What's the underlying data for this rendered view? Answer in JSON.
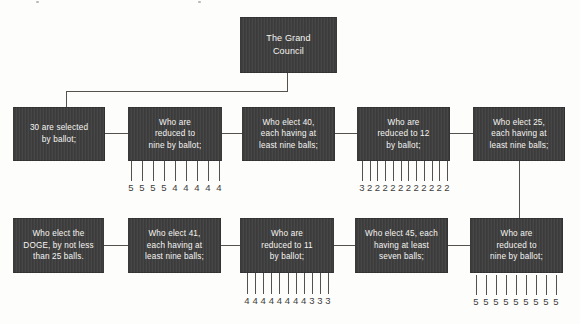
{
  "diagram": {
    "council": {
      "label": "The Grand\nCouncil"
    },
    "row1": [
      {
        "id": "node-30-selected",
        "label": "30 are selected\nby ballot;"
      },
      {
        "id": "node-reduced-to-nine-1",
        "label": "Who are\nreduced to\nnine by ballot;"
      },
      {
        "id": "node-elect-40",
        "label": "Who elect 40,\neach having at\nleast nine balls;"
      },
      {
        "id": "node-reduced-to-12",
        "label": "Who are\nreduced to 12\nby ballot;"
      },
      {
        "id": "node-elect-25",
        "label": "Who elect 25,\neach having at\nleast nine balls;"
      }
    ],
    "row2": [
      {
        "id": "node-elect-doge",
        "label": "Who elect the\nDOGE, by not less\nthan 25 balls."
      },
      {
        "id": "node-elect-41",
        "label": "Who elect 41,\neach having at\nleast nine balls;"
      },
      {
        "id": "node-reduced-to-11",
        "label": "Who are\nreduced to 11\nby ballot;"
      },
      {
        "id": "node-elect-45",
        "label": "Who elect 45, each\nhaving at least\nseven balls;"
      },
      {
        "id": "node-reduced-to-nine-2",
        "label": "Who are\nreduced to\nnine by ballot;"
      }
    ],
    "tick_groups": [
      {
        "under": "node-reduced-to-nine-1",
        "values": [
          5,
          5,
          5,
          5,
          4,
          4,
          4,
          4,
          4
        ]
      },
      {
        "under": "node-reduced-to-12",
        "values": [
          3,
          2,
          2,
          2,
          2,
          2,
          2,
          2,
          2,
          2,
          2,
          2
        ]
      },
      {
        "under": "node-reduced-to-11",
        "values": [
          4,
          4,
          4,
          4,
          4,
          4,
          4,
          4,
          3,
          3,
          3
        ]
      },
      {
        "under": "node-reduced-to-nine-2",
        "values": [
          5,
          5,
          5,
          5,
          5,
          5,
          5,
          5,
          5
        ]
      }
    ],
    "colors": {
      "background": "#fdfdfb",
      "box_fill": "#3f3f3f",
      "box_text": "#f6f5f2",
      "line": "#55524e",
      "digit": "#403e3b"
    }
  }
}
